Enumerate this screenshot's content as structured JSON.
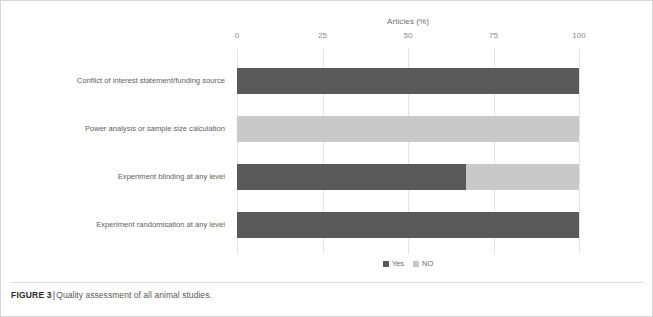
{
  "figure": {
    "label": "FIGURE 3",
    "separator": "|",
    "caption": "Quality assessment of all animal studies."
  },
  "chart_data": {
    "type": "bar",
    "orientation": "horizontal",
    "stacked": true,
    "title": "",
    "xlabel": "Articles (%)",
    "ylabel": "",
    "xlim": [
      0,
      100
    ],
    "xticks": [
      0,
      25,
      50,
      75,
      100
    ],
    "xtick_labels": [
      "0",
      "25",
      "50",
      "75",
      "100"
    ],
    "grid": true,
    "grid_axis": "x",
    "legend_position": "bottom",
    "categories": [
      "Conflict of interest statement/funding source",
      "Power analysis or sample size calculation",
      "Experiment blinding at any level",
      "Experiment randomisation at any level"
    ],
    "series": [
      {
        "name": "Yes",
        "color": "#595959",
        "values": [
          100,
          0,
          67,
          100
        ]
      },
      {
        "name": "NO",
        "color": "#c9c9c9",
        "values": [
          0,
          100,
          33,
          0
        ]
      }
    ]
  },
  "colors": {
    "yes": "#595959",
    "no": "#c9c9c9",
    "gridline": "#e3e3e3",
    "frame": "#d6d6d6",
    "tick_text": "#8a8a8a",
    "category_text": "#606060"
  }
}
